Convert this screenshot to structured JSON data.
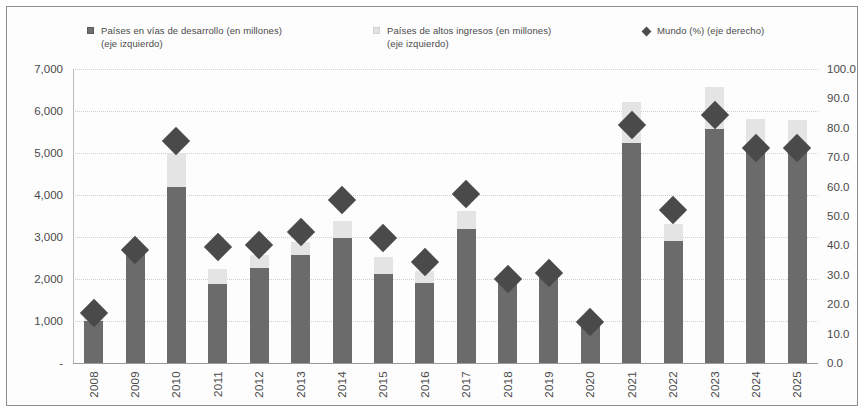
{
  "legend": {
    "series1": "Países en vías de desarrollo (en millones) (eje izquierdo)",
    "series1_line1": "Países en vías de desarrollo (en millones)",
    "series1_line2": "(eje izquierdo)",
    "series2_line1": "Países de altos ingresos (en millones)",
    "series2_line2": "(eje izquierdo)",
    "series3": "Mundo (%) (eje derecho)"
  },
  "colors": {
    "developing": "#6b6b6b",
    "high_income": "#e4e4e4",
    "world_marker": "#4a4a4a",
    "gridline": "#c9cfd6",
    "axis": "#8d8d8d",
    "text": "#4a4a4a"
  },
  "chart_data": {
    "type": "bar",
    "title": "",
    "subtitle": "",
    "xlabel": "",
    "ylabel": "",
    "y2label": "",
    "grid": true,
    "legend_position": "top",
    "stacked": true,
    "categories": [
      "2008",
      "2009",
      "2010",
      "2011",
      "2012",
      "2013",
      "2014",
      "2015",
      "2016",
      "2017",
      "2018",
      "2019",
      "2020",
      "2021",
      "2022",
      "2023",
      "2024",
      "2025"
    ],
    "ylim": [
      0,
      7000
    ],
    "yticks": [
      0,
      1000,
      2000,
      3000,
      4000,
      5000,
      6000,
      7000
    ],
    "ytick_labels": [
      "-",
      "1,000",
      "2,000",
      "3,000",
      "4,000",
      "5,000",
      "6,000",
      "7,000"
    ],
    "y2lim": [
      0,
      100
    ],
    "y2ticks": [
      0,
      10,
      20,
      30,
      40,
      50,
      60,
      70,
      80,
      90,
      100
    ],
    "y2tick_labels": [
      "0.0",
      "10.0",
      "20.0",
      "30.0",
      "40.0",
      "50.0",
      "60.0",
      "70.0",
      "80.0",
      "90.0",
      "100.0"
    ],
    "series": [
      {
        "name": "Países en vías de desarrollo (en millones)",
        "axis": "left",
        "type": "bar",
        "values": [
          1000,
          2600,
          4200,
          1870,
          2270,
          2560,
          2980,
          2120,
          1900,
          3200,
          1900,
          2050,
          980,
          5250,
          2900,
          5560,
          5060,
          5060
        ]
      },
      {
        "name": "Países de altos ingresos (en millones)",
        "axis": "left",
        "type": "bar",
        "values": [
          180,
          160,
          810,
          370,
          300,
          320,
          410,
          400,
          300,
          410,
          120,
          170,
          60,
          970,
          410,
          1000,
          740,
          720
        ]
      },
      {
        "name": "Mundo (%) (eje derecho)",
        "axis": "right",
        "type": "marker",
        "values": [
          17.0,
          38.5,
          75.5,
          39.5,
          40.0,
          44.5,
          55.5,
          42.5,
          34.5,
          57.5,
          28.5,
          30.5,
          14.0,
          81.0,
          52.0,
          84.5,
          73.0,
          73.0
        ]
      }
    ]
  }
}
